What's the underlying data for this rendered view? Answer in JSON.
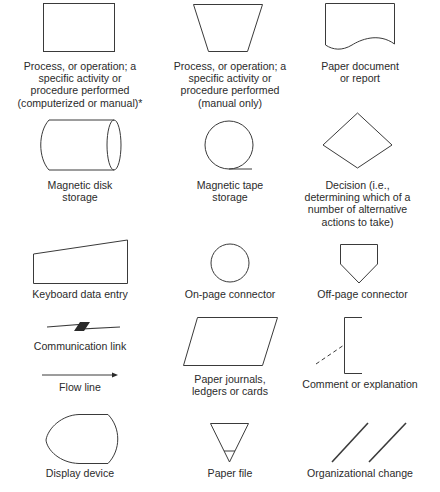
{
  "symbols": [
    {
      "id": "process",
      "label": "Process, or operation; a\nspecific activity or\nprocedure performed\n(computerized or manual)*"
    },
    {
      "id": "manual-process",
      "label": "Process, or operation; a\nspecific activity or\nprocedure performed\n(manual only)"
    },
    {
      "id": "paper-document",
      "label": "Paper document\nor report"
    },
    {
      "id": "magnetic-disk",
      "label": "Magnetic disk\nstorage"
    },
    {
      "id": "magnetic-tape",
      "label": "Magnetic tape\nstorage"
    },
    {
      "id": "decision",
      "label": "Decision (i.e.,\ndetermining which of a\nnumber of alternative\nactions to take)"
    },
    {
      "id": "keyboard-entry",
      "label": "Keyboard data entry"
    },
    {
      "id": "on-page-connector",
      "label": "On-page connector"
    },
    {
      "id": "off-page-connector",
      "label": "Off-page connector"
    },
    {
      "id": "communication-link",
      "label": "Communication link"
    },
    {
      "id": "paper-journals",
      "label": "Paper journals,\nledgers or cards"
    },
    {
      "id": "comment",
      "label": "Comment or explanation"
    },
    {
      "id": "flow-line",
      "label": "Flow line"
    },
    {
      "id": "display-device",
      "label": "Display device"
    },
    {
      "id": "paper-file",
      "label": "Paper file"
    },
    {
      "id": "organizational-change",
      "label": "Organizational change"
    }
  ],
  "colors": {
    "stroke": "#3a3a3a",
    "background": "#ffffff"
  }
}
